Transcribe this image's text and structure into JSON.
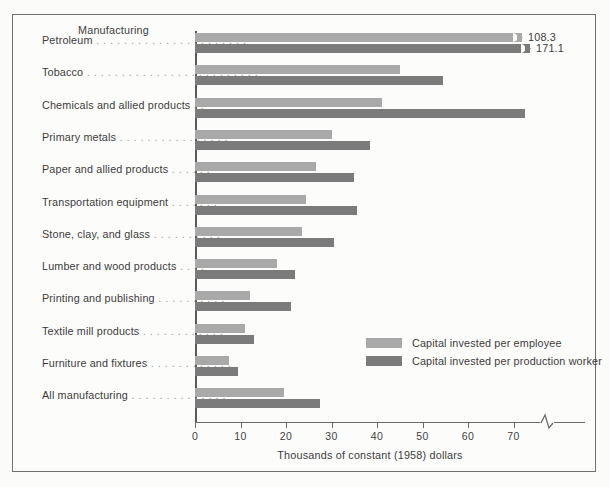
{
  "figure": {
    "header_label": "Manufacturing",
    "x_axis_title": "Thousands of constant (1958) dollars",
    "frame_color": "#6f6f6f",
    "light_color": "#a9a9a9",
    "dark_color": "#7b7b7b"
  },
  "legend": {
    "position": "inside-right",
    "items": [
      {
        "label": "Capital invested per employee",
        "color": "#a9a9a9"
      },
      {
        "label": "Capital invested per production worker",
        "color": "#7b7b7b"
      }
    ]
  },
  "chart_data": {
    "type": "bar",
    "orientation": "horizontal",
    "title": "Manufacturing",
    "xlabel": "Thousands of constant (1958) dollars",
    "ylabel": "",
    "xlim": [
      0,
      77
    ],
    "axis_break": true,
    "axis_break_after": 70,
    "grid": false,
    "tick_values": [
      0,
      10,
      20,
      30,
      40,
      50,
      60,
      70
    ],
    "tick_labels": [
      "0",
      "10",
      "20",
      "30",
      "40",
      "50",
      "60",
      "70"
    ],
    "categories": [
      "Petroleum",
      "Tobacco",
      "Chemicals and allied products",
      "Primary metals",
      "Paper and allied products",
      "Transportation equipment",
      "Stone, clay, and glass",
      "Lumber and wood products",
      "Printing and publishing",
      "Textile mill products",
      "Furniture and fixtures",
      "All manufacturing"
    ],
    "category_leaders": [
      ". . . . . . . . . . . . . . . . . . . . . .",
      ". . . . . . . . . . . . . . . . . . . . . . . . .",
      ". .",
      ". . . . . . . . . . . . . . . .",
      ". . . . . .",
      ". . . . . . .",
      ". . . . . . . . . .",
      ". . . .",
      ". . . . . . . . . .",
      ". . . . . . . . . . . .",
      ". . . . . . . . . . . .",
      ". . . . . . . . . . . . . ."
    ],
    "series": [
      {
        "name": "Capital invested per employee",
        "color": "#a9a9a9",
        "values": [
          108.3,
          45.0,
          41.0,
          30.0,
          26.5,
          24.5,
          23.5,
          18.0,
          12.0,
          11.0,
          7.5,
          19.5
        ]
      },
      {
        "name": "Capital invested per production worker",
        "color": "#7b7b7b",
        "values": [
          171.1,
          54.5,
          72.5,
          38.5,
          35.0,
          35.5,
          30.5,
          22.0,
          21.0,
          13.0,
          9.5,
          27.5
        ]
      }
    ],
    "annotations": [
      {
        "text": "108.3",
        "series": "Capital invested per employee",
        "category": "Petroleum"
      },
      {
        "text": "171.1",
        "series": "Capital invested per production worker",
        "category": "Petroleum"
      }
    ]
  }
}
